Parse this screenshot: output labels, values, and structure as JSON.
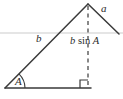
{
  "figure": {
    "background_color": "#ffffff",
    "stroke_color": "#3a3a3a",
    "guide_color": "#d9d9d9",
    "width": 123,
    "height": 99,
    "labels": {
      "side_a": "a",
      "side_b": "b",
      "angle_A": "A",
      "altitude_prefix": "b",
      "altitude_function": "sin",
      "altitude_angle": "A",
      "altitude_full": "b sin A"
    },
    "geometry": {
      "left_vertex": [
        5,
        88
      ],
      "apex": [
        88,
        4
      ],
      "right_vertex": [
        88,
        88
      ],
      "segment_a_end": [
        119,
        34
      ],
      "baseline_start": [
        5,
        88
      ],
      "baseline_end": [
        91,
        88
      ],
      "guide_line_y": 33,
      "guide_line_start_x": 0,
      "guide_line_end_x": 123,
      "right_angle_box_size": 8,
      "angle_arc_radius": 18
    }
  }
}
